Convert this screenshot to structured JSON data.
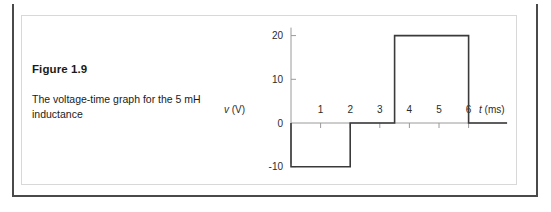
{
  "figure": {
    "number_label": "Figure 1.9",
    "caption": "The voltage-time graph for the 5 mH inductance"
  },
  "chart_data": {
    "type": "line",
    "title": "",
    "xlabel": "t (ms)",
    "xlabel_symbol": "t",
    "xlabel_unit": "(ms)",
    "ylabel": "v (V)",
    "ylabel_symbol": "v",
    "ylabel_unit": "(V)",
    "xlim": [
      0,
      7.3
    ],
    "ylim": [
      -10,
      20
    ],
    "xticks": [
      1,
      2,
      3,
      4,
      5,
      6
    ],
    "xtick_labels": [
      "1",
      "2",
      "3",
      "4",
      "5",
      "6"
    ],
    "yticks": [
      -10,
      0,
      10,
      20
    ],
    "ytick_labels": [
      "-10",
      "0",
      "10",
      "20"
    ],
    "grid": false,
    "legend": false,
    "series": [
      {
        "name": "v(t)",
        "color": "#3a3a3a",
        "x": [
          0,
          0,
          2,
          2,
          3.5,
          3.5,
          6,
          6,
          7.3
        ],
        "y": [
          0,
          -10,
          -10,
          0,
          0,
          20,
          20,
          0,
          0
        ]
      }
    ],
    "segments": [
      {
        "from_ms": 0,
        "to_ms": 2,
        "volts": -10
      },
      {
        "from_ms": 2,
        "to_ms": 3.5,
        "volts": 0
      },
      {
        "from_ms": 3.5,
        "to_ms": 6,
        "volts": 20
      },
      {
        "from_ms": 6,
        "to_ms": 7.3,
        "volts": 0
      }
    ]
  },
  "colors": {
    "frame_dark": "#4a4a4a",
    "panel_border": "#d8d8d8",
    "axis": "#9a9a9a",
    "waveform": "#3a3a3a",
    "text": "#1a1a1a"
  }
}
